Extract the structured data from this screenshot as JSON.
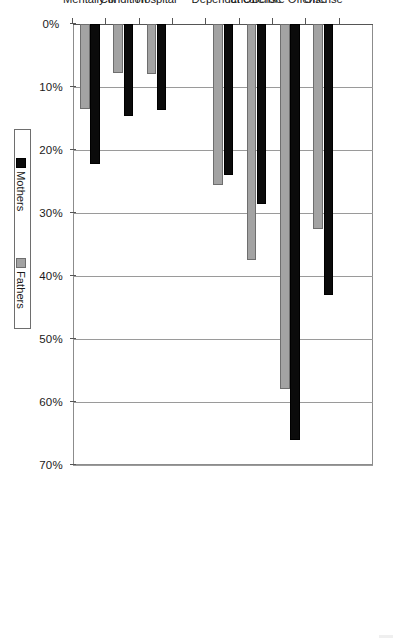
{
  "chart_data": {
    "type": "bar",
    "title": "",
    "subtitle": "",
    "orientation": "rotated-90",
    "xlabel": "",
    "ylabel": "",
    "ylim": [
      0,
      70
    ],
    "ytick_step": 10,
    "grid": true,
    "legend_position": "right",
    "tick_labels": [
      "0%",
      "10%",
      "20%",
      "30%",
      "40%",
      "50%",
      "60%",
      "70%"
    ],
    "tick_values": [
      0,
      10,
      20,
      30,
      40,
      50,
      60,
      70
    ],
    "categories": [
      "SUBSTANCE USE",
      "% Using Illegal Drugs at\nOffense",
      "% Using Illegal Drugs Month\nBefore Offense",
      "% Under Influence of Alcohol\nat Offense",
      "% History of Alcohol\nDependence",
      "MENTAL HEALTH STATUS",
      "% Overnight Stay at Mental\nHospital",
      "% Mental or Emotional\nCondition",
      "% Self-Reported Diagnosed\nMentally Ill"
    ],
    "category_kinds": [
      "section",
      "data",
      "data",
      "data",
      "data",
      "section",
      "data",
      "data",
      "data"
    ],
    "series": [
      {
        "name": "Mothers",
        "color": "#0b0b0b",
        "values": [
          null,
          43,
          66,
          28.5,
          24,
          null,
          13.7,
          14.6,
          22.2
        ]
      },
      {
        "name": "Fathers",
        "color": "#a3a3a3",
        "values": [
          null,
          32.5,
          58,
          37.5,
          25.5,
          null,
          8,
          7.7,
          13.5
        ]
      }
    ]
  },
  "legend": {
    "entries": [
      {
        "label": "Mothers",
        "swatch": "mothers"
      },
      {
        "label": "Fathers",
        "swatch": "fathers"
      }
    ]
  },
  "colors": {
    "mothers": "#0b0b0b",
    "fathers": "#a3a3a3",
    "gridline": "#9a9a9a",
    "axis": "#555555",
    "background": "#ffffff"
  }
}
